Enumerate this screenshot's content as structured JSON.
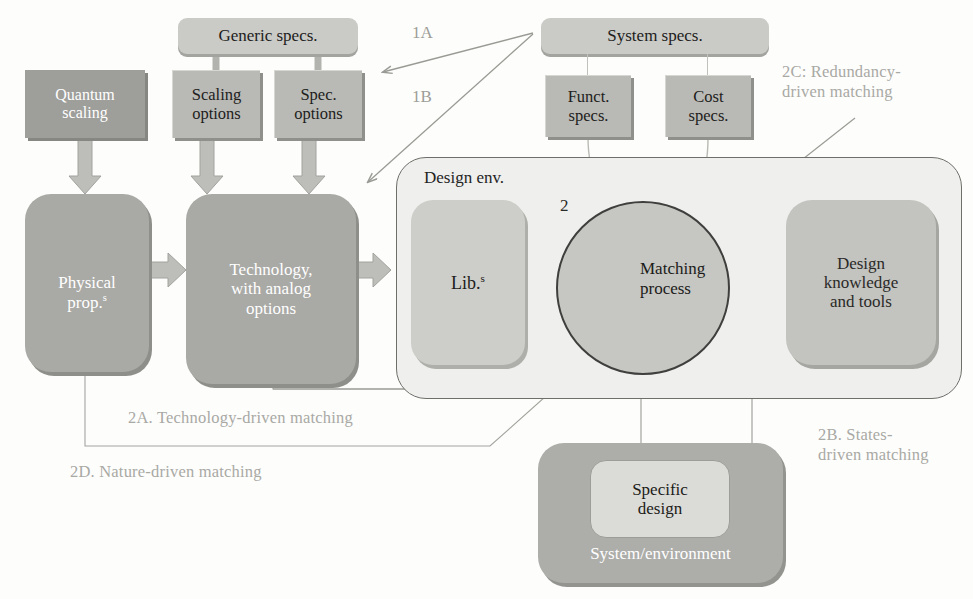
{
  "diagram": {
    "colors": {
      "dark_box": "#9e9e9b",
      "mid_box": "#b9b9b5",
      "light_box": "#c9c9c5",
      "env_fill": "#efefed",
      "circle_fill": "#c6c6c2",
      "arrow_dark": "#6f6f6c",
      "block_arrow": "#c3c3bf",
      "label_text": "#a9a9a4",
      "line": "#8f8f8b"
    },
    "nodes": {
      "quantum_scaling": "Quantum\nscaling",
      "generic_specs": "Generic specs.",
      "scaling_options": "Scaling\noptions",
      "spec_options": "Spec.\noptions",
      "system_specs": "System specs.",
      "funct_specs": "Funct.\nspecs.",
      "cost_specs": "Cost\nspecs.",
      "physical_prop": "Physical\nprop.",
      "physical_prop_sup": "s",
      "technology": "Technology,\nwith analog\noptions",
      "design_env": "Design env.",
      "libraries": "Lib.",
      "libraries_sup": "s",
      "matching_process": "Matching\nprocess",
      "design_knowledge": "Design\nknowledge\nand tools",
      "specific_design": "Specific\ndesign",
      "system_environment": "System/environment"
    },
    "annotations": {
      "a1": "1A",
      "b1": "1B",
      "n2": "2",
      "c2": "2C: Redundancy-\ndriven matching",
      "a2": "2A. Technology-driven matching",
      "b2": "2B. States-\ndriven matching",
      "d2": "2D. Nature-driven matching"
    }
  }
}
